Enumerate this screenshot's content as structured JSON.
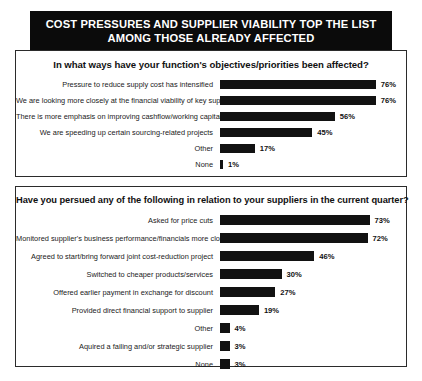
{
  "banner": {
    "line1": "COST PRESSURES AND SUPPLIER VIABILITY TOP THE LIST",
    "line2": "AMONG THOSE ALREADY AFFECTED"
  },
  "chart_data": [
    {
      "type": "bar",
      "orientation": "horizontal",
      "title": "In what ways have your function's objectives/priorities been affected?",
      "xlabel": "",
      "ylabel": "",
      "xlim": [
        0,
        100
      ],
      "value_suffix": "%",
      "grid": false,
      "legend": "none",
      "categories": [
        "Pressure to reduce supply cost has intensified",
        "We are looking more closely at the financial viability of key suppliers",
        "There is more emphasis on improving cashflow/working capital",
        "We are speeding up certain sourcing-related projects",
        "Other",
        "None"
      ],
      "values": [
        76,
        76,
        56,
        45,
        17,
        1
      ],
      "labels": [
        "76%",
        "76%",
        "56%",
        "45%",
        "17%",
        "1%"
      ]
    },
    {
      "type": "bar",
      "orientation": "horizontal",
      "title": "Have you persued any of the following in relation to your suppliers in the current quarter?",
      "xlabel": "",
      "ylabel": "",
      "xlim": [
        0,
        100
      ],
      "value_suffix": "%",
      "grid": false,
      "legend": "none",
      "categories": [
        "Asked for price cuts",
        "Monitored supplier's business performance/financials more closely",
        "Agreed to start/bring forward joint cost-reduction project",
        "Switched to cheaper products/services",
        "Offered earlier payment in exchange for discount",
        "Provided direct financial support to supplier",
        "Other",
        "Aquired a failing and/or strategic supplier",
        "None"
      ],
      "values": [
        73,
        72,
        46,
        30,
        27,
        19,
        4,
        3,
        3
      ],
      "labels": [
        "73%",
        "72%",
        "46%",
        "30%",
        "27%",
        "19%",
        "4%",
        "3%",
        "3%"
      ]
    }
  ],
  "style": {
    "bar_color": "#121212",
    "banner_bg": "#0b0b0b",
    "banner_text": "#ffffff",
    "panel_border": "#2b2b2b"
  }
}
